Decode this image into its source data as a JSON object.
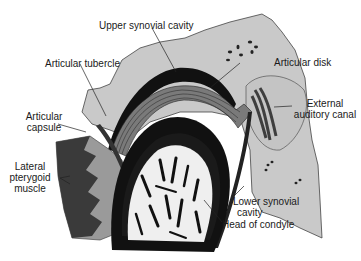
{
  "diagram": {
    "colors": {
      "bone_gray": "#c9c9c9",
      "dark": "#111111",
      "muscle_dark": "#3a3a3a",
      "muscle_light": "#9a9a9a",
      "marrow": "#efefef",
      "text": "#1a1a1a"
    },
    "labels": {
      "upper_synovial_cavity": "Upper synovial cavity",
      "articular_tubercle": "Articular tubercle",
      "articular_disk": "Articular disk",
      "articular_capsule_1": "Articular",
      "articular_capsule_2": "capsule",
      "external_auditory_canal_1": "External",
      "external_auditory_canal_2": "auditory canal",
      "lateral_pterygoid_1": "Lateral",
      "lateral_pterygoid_2": "pterygoid",
      "lateral_pterygoid_3": "muscle",
      "lower_synovial_cavity_1": "Lower synovial",
      "lower_synovial_cavity_2": "cavity",
      "head_of_condyle": "Head of condyle"
    }
  }
}
